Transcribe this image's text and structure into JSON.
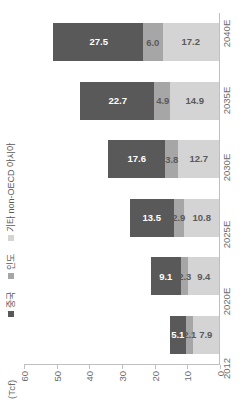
{
  "chart_data": {
    "type": "bar",
    "subtype": "stacked-bar",
    "title": "",
    "subtitle": "",
    "xlabel": "",
    "ylabel": "(Tcf)",
    "unit_label": "(Tcf)",
    "categories": [
      "2012",
      "2020E",
      "2025E",
      "2030E",
      "2035E",
      "2040E"
    ],
    "series": [
      {
        "name": "중국",
        "color": "#595959",
        "values": [
          5.1,
          9.1,
          13.5,
          17.6,
          22.7,
          27.5
        ],
        "labels": [
          "5.1",
          "9.1",
          "13.5",
          "17.6",
          "22.7",
          "27.5"
        ]
      },
      {
        "name": "인도",
        "color": "#a6a6a6",
        "values": [
          2.1,
          2.3,
          2.9,
          3.8,
          4.9,
          6.0
        ],
        "labels": [
          "2.1",
          "2.3",
          "2.9",
          "3.8",
          "4.9",
          "6.0"
        ]
      },
      {
        "name": "기타 non-OECD 아시아",
        "color": "#d4d4d4",
        "values": [
          7.9,
          9.4,
          10.8,
          12.7,
          14.9,
          17.2
        ],
        "labels": [
          "7.9",
          "9.4",
          "10.8",
          "12.7",
          "14.9",
          "17.2"
        ]
      }
    ],
    "stack_order": [
      "기타 non-OECD 아시아",
      "인도",
      "중국"
    ],
    "totals": [
      15.1,
      20.8,
      27.2,
      34.1,
      42.5,
      50.7
    ],
    "ylim": [
      0,
      60
    ],
    "yticks": [
      "0",
      "10",
      "20",
      "30",
      "40",
      "50",
      "60"
    ],
    "ytick_values": [
      0,
      10,
      20,
      30,
      40,
      50,
      60
    ],
    "grid": false,
    "legend_position": "top-left",
    "orientation": "rotated-90-ccw"
  },
  "legend": {
    "items": [
      {
        "label": "중국",
        "color": "#595959"
      },
      {
        "label": "인도",
        "color": "#a6a6a6"
      },
      {
        "label": "기타 non-OECD 아시아",
        "color": "#d4d4d4"
      }
    ]
  },
  "axis": {
    "unit": "(Tcf)"
  }
}
